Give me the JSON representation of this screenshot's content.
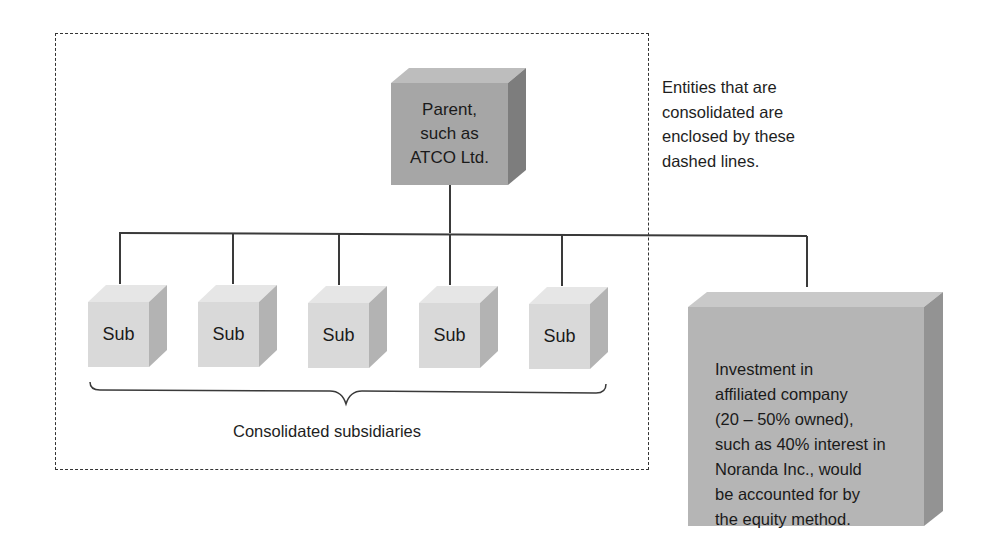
{
  "diagram": {
    "parent": {
      "lines": [
        "Parent,",
        "such as",
        "ATCO Ltd."
      ]
    },
    "subsidiaries": [
      {
        "label": "Sub"
      },
      {
        "label": "Sub"
      },
      {
        "label": "Sub"
      },
      {
        "label": "Sub"
      },
      {
        "label": "Sub"
      }
    ],
    "subsidiaries_group_label": "Consolidated subsidiaries",
    "annotation": {
      "lines": [
        "Entities that are",
        "consolidated are",
        "enclosed by these",
        "dashed lines."
      ]
    },
    "affiliate": {
      "lines": [
        "Investment in",
        "affiliated company",
        "(20 – 50% owned),",
        "such as 40% interest in",
        "Noranda Inc., would",
        "be accounted for by",
        "the equity method."
      ]
    },
    "colors": {
      "small_box_front": "#d9d9d9",
      "small_box_top": "#e6e6e6",
      "small_box_side": "#b3b3b3",
      "parent_front": "#a6a6a6",
      "parent_top": "#bdbdbd",
      "parent_side": "#7d7d7d",
      "affiliate_front": "#b5b5b5",
      "affiliate_top": "#c9c9c9",
      "affiliate_side": "#939393",
      "lines": "#3a3a3a"
    }
  }
}
